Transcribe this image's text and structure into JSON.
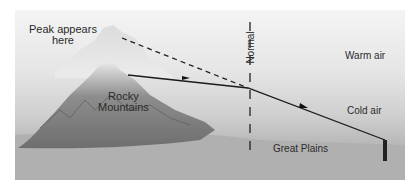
{
  "diagram": {
    "labels": {
      "peak_appears": [
        "Peak appears",
        "here"
      ],
      "rocky_mountains": [
        "Rocky",
        "Mountains"
      ],
      "normal": "Normal",
      "warm_air": "Warm air",
      "cold_air": "Cold air",
      "great_plains": "Great Plains"
    }
  }
}
